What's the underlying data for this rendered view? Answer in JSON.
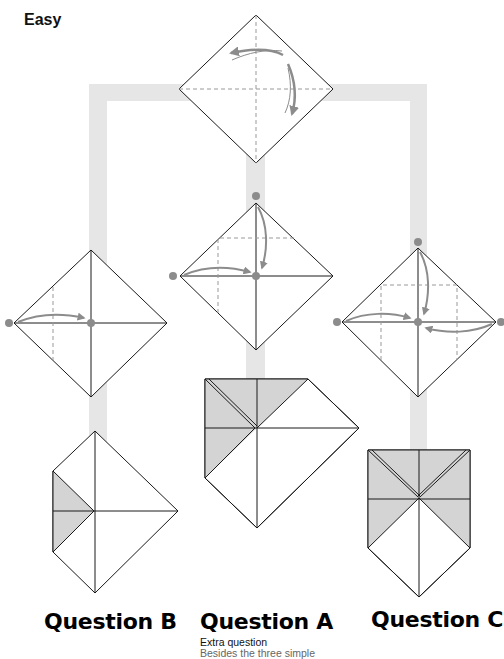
{
  "header": {
    "level": "Easy"
  },
  "colors": {
    "connector": "#e6e6e6",
    "line": "#1a1a1a",
    "dashed": "#999999",
    "arrow": "#8c8c8c",
    "dot": "#8c8c8c",
    "shade": "#d4d4d4"
  },
  "steps": [
    {
      "id": "start",
      "description": "Square with center creases, fold arrows"
    },
    {
      "id": "step-a",
      "description": "Fold top and left corners to center"
    },
    {
      "id": "step-b",
      "description": "Fold left corner to center"
    },
    {
      "id": "step-c",
      "description": "Fold top, left and right corners to center"
    }
  ],
  "questions": {
    "b": {
      "label": "Question B"
    },
    "a": {
      "label": "Question A",
      "extra_title": "Extra question",
      "extra_body": "Besides the three simple"
    },
    "c": {
      "label": "Question C"
    }
  }
}
